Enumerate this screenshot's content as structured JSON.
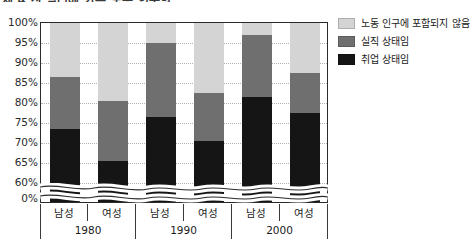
{
  "title": "제 4 장 일터에 가는 노동 인구의",
  "chart_data": {
    "type": "bar",
    "stacked": true,
    "title": "제 4 장 일터에 가는 노동 인구의",
    "xlabel": "",
    "ylabel": "",
    "ylim": [
      60,
      100
    ],
    "y_axis_break": true,
    "y_break_floor": 0,
    "grid": true,
    "grid_style": "dotted-horizontal",
    "legend_position": "right",
    "ytick_labels": [
      "100%",
      "95%",
      "90%",
      "85%",
      "80%",
      "75%",
      "70%",
      "65%",
      "60%",
      "0%"
    ],
    "ytick_values": [
      100,
      95,
      90,
      85,
      80,
      75,
      70,
      65,
      60,
      0
    ],
    "groups": [
      "1980",
      "1990",
      "2000"
    ],
    "categories": [
      "남성",
      "여성",
      "남성",
      "여성",
      "남성",
      "여성"
    ],
    "series": [
      {
        "name": "취업 상태임",
        "color": "#151515",
        "values": [
          73.0,
          65.0,
          76.0,
          70.0,
          81.0,
          77.0
        ]
      },
      {
        "name": "실직 상태임",
        "color": "#6f6f6f",
        "values": [
          13.0,
          15.0,
          18.5,
          12.0,
          15.5,
          10.0
        ]
      },
      {
        "name": "노동 인구에 포함되지 않음",
        "color": "#d4d4d4",
        "values": [
          14.0,
          20.0,
          5.5,
          18.0,
          3.5,
          13.0
        ]
      }
    ],
    "cumulative_tops": {
      "취업 상태임": [
        73.0,
        65.0,
        76.0,
        70.0,
        81.0,
        77.0
      ],
      "실직 상태임": [
        86.0,
        80.0,
        94.5,
        82.0,
        96.5,
        87.0
      ],
      "노동 인구에 포함되지 않음": [
        100,
        100,
        100,
        100,
        100,
        100
      ]
    }
  },
  "legend": {
    "items": [
      {
        "label": "노동 인구에 포함되지 않음",
        "color": "#d4d4d4"
      },
      {
        "label": "실직 상태임",
        "color": "#6f6f6f"
      },
      {
        "label": "취업 상태임",
        "color": "#151515"
      }
    ]
  },
  "xaxis": {
    "categories": [
      "남성",
      "여성",
      "남성",
      "여성",
      "남성",
      "여성"
    ],
    "groups": [
      "1980",
      "1990",
      "2000"
    ]
  }
}
